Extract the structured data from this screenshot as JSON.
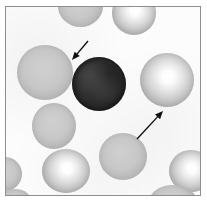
{
  "figure": {
    "domain_label": "light-microscopy blood smear photomicrograph",
    "caption": "",
    "frame_border_color": "#8e8e8e",
    "background_color": "#ffffff",
    "field_color": "#fcfcfc",
    "width_px": 207,
    "height_px": 208
  },
  "annotations": {
    "arrows": [
      {
        "name": "arrow-upper-left",
        "points_to": "dark nucleated cell",
        "direction": "down-left",
        "tail_x": 82,
        "tail_y": 34,
        "head_x": 66,
        "head_y": 53,
        "color": "#111111"
      },
      {
        "name": "arrow-lower-right",
        "points_to": "pale-centred erythrocyte",
        "direction": "up-right",
        "tail_x": 131,
        "tail_y": 132,
        "head_x": 157,
        "head_y": 104,
        "color": "#111111"
      }
    ]
  },
  "cells": [
    {
      "name": "erythrocyte-top-partial-left",
      "type": "rbc-flat",
      "x": 52,
      "y": -22,
      "w": 45,
      "h": 42,
      "label": "partially cropped erythrocyte at upper border"
    },
    {
      "name": "erythrocyte-top-partial-right",
      "type": "rbc-pallor",
      "x": 106,
      "y": -16,
      "w": 44,
      "h": 44,
      "label": "partially cropped erythrocyte at upper border"
    },
    {
      "name": "erythrocyte-left-upper",
      "type": "rbc-flat",
      "x": 11,
      "y": 38,
      "w": 56,
      "h": 55,
      "label": "erythrocyte, upper left"
    },
    {
      "name": "erythrocyte-left-middle",
      "type": "rbc-flat",
      "x": 26,
      "y": 96,
      "w": 44,
      "h": 46,
      "label": "erythrocyte, mid left"
    },
    {
      "name": "erythrocyte-left-lower",
      "type": "rbc-pallor",
      "x": 36,
      "y": 142,
      "w": 48,
      "h": 44,
      "label": "erythrocyte with marked central pallor, lower left"
    },
    {
      "name": "erythrocyte-bottom-centre",
      "type": "rbc-flat",
      "x": 93,
      "y": 126,
      "w": 48,
      "h": 47,
      "label": "erythrocyte, bottom centre"
    },
    {
      "name": "erythrocyte-right-pallor",
      "type": "rbc-pallor",
      "x": 134,
      "y": 46,
      "w": 54,
      "h": 54,
      "label": "erythrocyte with prominent central pallor, indicated by lower arrow"
    },
    {
      "name": "erythrocyte-right-lower",
      "type": "rbc-pallor",
      "x": 163,
      "y": 143,
      "w": 44,
      "h": 42,
      "label": "partially cropped erythrocyte at right border"
    },
    {
      "name": "erythrocyte-bottom-right-edge",
      "type": "rbc-flat",
      "x": 143,
      "y": 178,
      "w": 48,
      "h": 34,
      "label": "partially cropped erythrocyte at lower border"
    },
    {
      "name": "erythrocyte-left-edge-faint",
      "type": "rbc-flat",
      "x": -18,
      "y": 150,
      "w": 34,
      "h": 34,
      "label": "faint partially cropped erythrocyte at left border"
    },
    {
      "name": "erythrocyte-bottom-left-edge",
      "type": "rbc-flat",
      "x": -8,
      "y": 182,
      "w": 34,
      "h": 28,
      "label": "faint partially cropped erythrocyte at lower left border"
    }
  ],
  "nucleated_cell": {
    "name": "dark-nucleated-cell",
    "type": "dark-cell",
    "x": 66,
    "y": 50,
    "w": 54,
    "h": 54,
    "label": "dark, densely stained nucleated cell indicated by upper arrow",
    "color": "#2b2b2b"
  }
}
